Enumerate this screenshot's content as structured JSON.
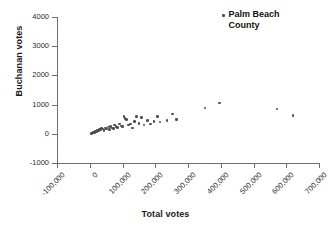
{
  "chart_data": {
    "type": "scatter",
    "title": "",
    "xlabel": "Total votes",
    "ylabel": "Buchanan votes",
    "xlim": [
      -100000,
      700000
    ],
    "ylim": [
      -1000,
      4000
    ],
    "xticks": [
      -100000,
      0,
      100000,
      200000,
      300000,
      400000,
      500000,
      600000,
      700000
    ],
    "xticklabels": [
      "-100,000",
      "0",
      "100,000",
      "200,000",
      "300,000",
      "400,000",
      "500,000",
      "600,000",
      "700,000"
    ],
    "yticks": [
      -1000,
      0,
      1000,
      2000,
      3000,
      4000
    ],
    "yticklabels": [
      "-1000",
      "0",
      "1000",
      "2000",
      "3000",
      "4000"
    ],
    "grid": false,
    "legend_position": "top-right",
    "marker_color": "#4d4d4d",
    "series": [
      {
        "name": "Palm Beach County",
        "points": [
          [
            5000,
            20
          ],
          [
            9000,
            30
          ],
          [
            11000,
            60
          ],
          [
            14000,
            50
          ],
          [
            17000,
            90
          ],
          [
            20000,
            70
          ],
          [
            23000,
            120
          ],
          [
            26000,
            100
          ],
          [
            29000,
            150
          ],
          [
            32000,
            130
          ],
          [
            36000,
            180
          ],
          [
            40000,
            160
          ],
          [
            44000,
            120
          ],
          [
            48000,
            200
          ],
          [
            52000,
            170
          ],
          [
            56000,
            230
          ],
          [
            60000,
            150
          ],
          [
            64000,
            260
          ],
          [
            68000,
            200
          ],
          [
            72000,
            180
          ],
          [
            76000,
            300
          ],
          [
            80000,
            240
          ],
          [
            84000,
            210
          ],
          [
            90000,
            330
          ],
          [
            95000,
            270
          ],
          [
            100000,
            250
          ],
          [
            104000,
            600
          ],
          [
            108000,
            520
          ],
          [
            112000,
            480
          ],
          [
            118000,
            300
          ],
          [
            124000,
            340
          ],
          [
            130000,
            200
          ],
          [
            136000,
            430
          ],
          [
            142000,
            600
          ],
          [
            150000,
            350
          ],
          [
            158000,
            560
          ],
          [
            166000,
            300
          ],
          [
            176000,
            450
          ],
          [
            186000,
            340
          ],
          [
            196000,
            430
          ],
          [
            206000,
            600
          ],
          [
            214000,
            410
          ],
          [
            236000,
            450
          ],
          [
            252000,
            680
          ],
          [
            264000,
            480
          ],
          [
            352000,
            890
          ],
          [
            396000,
            1060
          ],
          [
            572000,
            850
          ],
          [
            620000,
            630
          ]
        ]
      }
    ]
  },
  "legend": {
    "label": "Palm Beach County"
  }
}
